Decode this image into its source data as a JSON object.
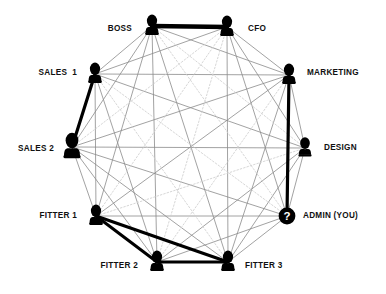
{
  "diagram": {
    "type": "sociogram",
    "layout": "circular",
    "background_color": "#ffffff",
    "node_color": "#000000",
    "thin_edge_color": "#8a8a8a",
    "faint_edge_color": "#cfcfcf",
    "thick_edge_color": "#000000",
    "label_color": "#111111"
  },
  "nodes": [
    {
      "id": "boss",
      "label": "BOSS",
      "x": 152,
      "y": 26,
      "icon": "person-silhouette-icon",
      "label_x": 132,
      "label_y": 29,
      "label_side": "left",
      "size": 1.0
    },
    {
      "id": "cfo",
      "label": "CFO",
      "x": 227,
      "y": 27,
      "icon": "person-silhouette-icon",
      "label_x": 248,
      "label_y": 29,
      "label_side": "right",
      "size": 1.0
    },
    {
      "id": "marketing",
      "label": "MARKETING",
      "x": 289,
      "y": 75,
      "icon": "person-silhouette-icon",
      "label_x": 307,
      "label_y": 73,
      "label_side": "right",
      "size": 1.0
    },
    {
      "id": "design",
      "label": "DESIGN",
      "x": 305,
      "y": 148,
      "icon": "person-silhouette-icon",
      "label_x": 324,
      "label_y": 148,
      "label_side": "right",
      "size": 0.95
    },
    {
      "id": "admin",
      "label": "ADMIN (YOU)",
      "x": 287,
      "y": 216,
      "icon": "question-mark-circle-icon",
      "label_x": 303,
      "label_y": 216,
      "label_side": "right",
      "size": 1.0
    },
    {
      "id": "fitter3",
      "label": "FITTER 3",
      "x": 228,
      "y": 262,
      "icon": "person-silhouette-icon",
      "label_x": 245,
      "label_y": 266,
      "label_side": "right",
      "size": 1.0
    },
    {
      "id": "fitter2",
      "label": "FITTER 2",
      "x": 157,
      "y": 262,
      "icon": "person-silhouette-icon",
      "label_x": 138,
      "label_y": 266,
      "label_side": "left",
      "size": 1.0
    },
    {
      "id": "fitter1",
      "label": "FITTER 1",
      "x": 96,
      "y": 216,
      "icon": "person-silhouette-icon",
      "label_x": 77,
      "label_y": 216,
      "label_side": "left",
      "size": 1.0
    },
    {
      "id": "sales2",
      "label": "SALES 2",
      "x": 72,
      "y": 147,
      "icon": "person-silhouette-icon",
      "label_x": 54,
      "label_y": 149,
      "label_side": "left",
      "size": 1.25
    },
    {
      "id": "sales1",
      "label": "SALES  1",
      "x": 95,
      "y": 74,
      "icon": "person-silhouette-icon",
      "label_x": 77,
      "label_y": 73,
      "label_side": "left",
      "size": 1.0
    }
  ],
  "strong_edges": [
    {
      "from": "boss",
      "to": "cfo",
      "weight": 4.5
    },
    {
      "from": "sales1",
      "to": "sales2",
      "weight": 3.2
    },
    {
      "from": "marketing",
      "to": "admin",
      "weight": 3.2
    },
    {
      "from": "fitter1",
      "to": "fitter2",
      "weight": 3.0
    },
    {
      "from": "fitter1",
      "to": "fitter3",
      "weight": 3.0
    },
    {
      "from": "fitter2",
      "to": "fitter3",
      "weight": 3.2
    }
  ],
  "faint_edges": [
    {
      "from": "boss",
      "to": "design"
    },
    {
      "from": "cfo",
      "to": "fitter1"
    },
    {
      "from": "cfo",
      "to": "sales2"
    },
    {
      "from": "marketing",
      "to": "fitter2"
    },
    {
      "from": "design",
      "to": "fitter1"
    },
    {
      "from": "admin",
      "to": "sales1"
    },
    {
      "from": "boss",
      "to": "admin"
    },
    {
      "from": "cfo",
      "to": "fitter2"
    },
    {
      "from": "sales1",
      "to": "fitter3"
    }
  ],
  "edge_notes": {
    "description": "Near-complete graph: every pair of nodes is joined by a thin line; six relationships are highlighted with thick black lines.",
    "thin_count": 45,
    "thick_count": 6
  }
}
